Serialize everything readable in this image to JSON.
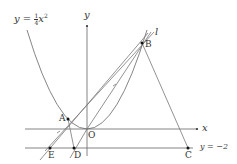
{
  "figure": {
    "title_equation": {
      "lhs": "y",
      "eq": "=",
      "frac_num": "1",
      "frac_den": "4",
      "var": "x",
      "exp": "2"
    },
    "axes": {
      "x_label": "x",
      "y_label": "y",
      "origin_label": "O"
    },
    "line_label": "l",
    "horizontal_line_label": "y = −2",
    "points": {
      "A": "A",
      "B": "B",
      "C": "C",
      "D": "D",
      "E": "E"
    },
    "colors": {
      "stroke": "#666666",
      "point": "#111111",
      "text": "#333333"
    }
  }
}
